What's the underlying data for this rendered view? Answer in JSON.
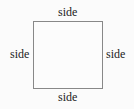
{
  "diagram": {
    "shape": "square",
    "labels": {
      "top": "side",
      "bottom": "side",
      "left": "side",
      "right": "side"
    },
    "colors": {
      "stroke": "#888888",
      "text": "#222222",
      "background": "#fbfbfb"
    }
  }
}
